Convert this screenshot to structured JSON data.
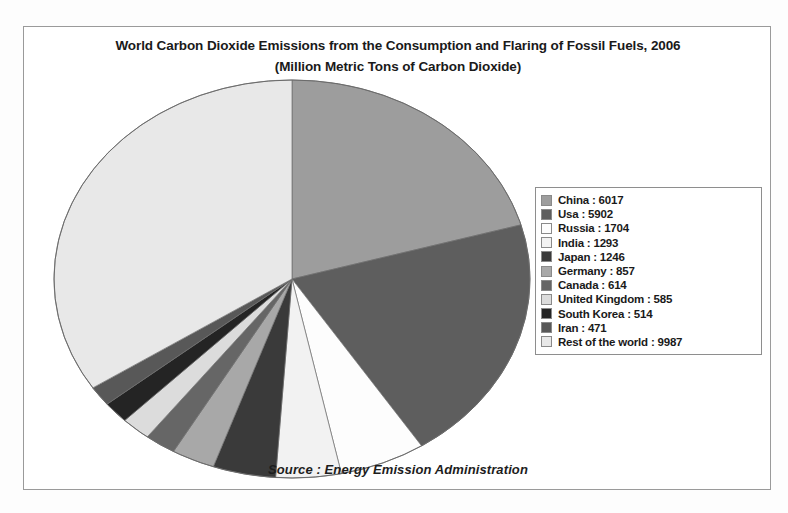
{
  "frame": {
    "title_line1": "World Carbon Dioxide Emissions from the Consumption and Flaring of Fossil Fuels, 2006",
    "title_line2": "(Million Metric Tons of Carbon Dioxide)",
    "source": "Source : Energy Emission Administration"
  },
  "chart_data": {
    "type": "pie",
    "title": "World Carbon Dioxide Emissions from the Consumption and Flaring of Fossil Fuels, 2006",
    "subtitle": "(Million Metric Tons of Carbon Dioxide)",
    "unit": "Million Metric Tons of Carbon Dioxide",
    "legend_position": "right",
    "start_angle_deg": 0,
    "direction": "clockwise",
    "categories": [
      "China",
      "Usa",
      "Russia",
      "India",
      "Japan",
      "Germany",
      "Canada",
      "United Kingdom",
      "South Korea",
      "Iran",
      "Rest of the world"
    ],
    "values": [
      6017,
      5902,
      1704,
      1293,
      1246,
      857,
      614,
      585,
      514,
      471,
      9987
    ],
    "total": 29190,
    "colors": [
      "#9d9d9d",
      "#5e5e5e",
      "#fdfdfd",
      "#f2f2f2",
      "#3a3a3a",
      "#a8a8a8",
      "#666666",
      "#dcdcdc",
      "#242424",
      "#585858",
      "#e8e8e8"
    ],
    "labels": [
      "China : 6017",
      "Usa : 5902",
      "Russia : 1704",
      "India : 1293",
      "Japan : 1246",
      "Germany : 857",
      "Canada : 614",
      "United Kingdom : 585",
      "South Korea : 514",
      "Iran : 471",
      "Rest of the world : 9987"
    ]
  },
  "legend": {
    "items": [
      {
        "label": "China : 6017",
        "color": "#9d9d9d"
      },
      {
        "label": "Usa : 5902",
        "color": "#5e5e5e"
      },
      {
        "label": "Russia : 1704",
        "color": "#fdfdfd"
      },
      {
        "label": "India : 1293",
        "color": "#f2f2f2"
      },
      {
        "label": "Japan : 1246",
        "color": "#3a3a3a"
      },
      {
        "label": "Germany : 857",
        "color": "#a8a8a8"
      },
      {
        "label": "Canada : 614",
        "color": "#666666"
      },
      {
        "label": "United Kingdom : 585",
        "color": "#dcdcdc"
      },
      {
        "label": "South Korea : 514",
        "color": "#242424"
      },
      {
        "label": "Iran : 471",
        "color": "#585858"
      },
      {
        "label": "Rest of the world : 9987",
        "color": "#e8e8e8"
      }
    ]
  }
}
